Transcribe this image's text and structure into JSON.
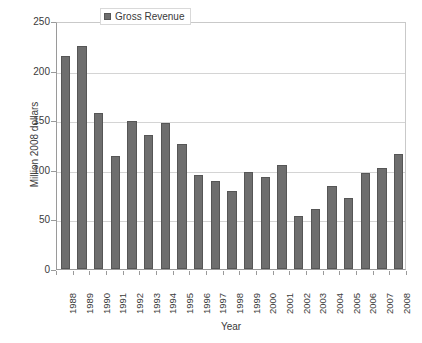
{
  "chart_data": {
    "type": "bar",
    "title": "",
    "xlabel": "Year",
    "ylabel": "Million 2008 dollars",
    "ylim": [
      0,
      250
    ],
    "yticks": [
      0,
      50,
      100,
      150,
      200,
      250
    ],
    "grid": true,
    "legend_position": "top-center",
    "legend_entries": [
      "Gross Revenue"
    ],
    "series_name": "Gross Revenue",
    "bar_color": "#6e6e6e",
    "bar_border_color": "#565656",
    "grid_color": "#d4d4d4",
    "axis_color": "#9a9a9a",
    "categories": [
      "1988",
      "1989",
      "1990",
      "1991",
      "1992",
      "1993",
      "1994",
      "1995",
      "1996",
      "1997",
      "1998",
      "1999",
      "2000",
      "2001",
      "2002",
      "2003",
      "2004",
      "2005",
      "2006",
      "2007",
      "2008"
    ],
    "values": [
      215,
      225,
      157,
      114,
      149,
      135,
      147,
      126,
      95,
      89,
      79,
      98,
      93,
      105,
      53,
      61,
      84,
      72,
      97,
      102,
      116
    ]
  }
}
